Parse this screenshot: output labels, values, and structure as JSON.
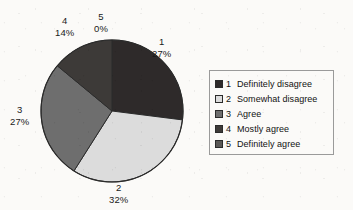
{
  "chart_data": {
    "type": "pie",
    "title": "",
    "categories": [
      "1",
      "2",
      "3",
      "4",
      "5"
    ],
    "values": [
      27,
      32,
      27,
      14,
      0
    ],
    "value_unit": "%",
    "labels": [
      {
        "name": "1",
        "pct": "27%"
      },
      {
        "name": "2",
        "pct": "32%"
      },
      {
        "name": "3",
        "pct": "27%"
      },
      {
        "name": "4",
        "pct": "14%"
      },
      {
        "name": "5",
        "pct": "0%"
      }
    ],
    "legend": {
      "position": "right",
      "entries": [
        {
          "key": "1",
          "label": "Definitely disagree",
          "color": "#2e2a2a"
        },
        {
          "key": "2",
          "label": "Somewhat disagree",
          "color": "#dcdcdc"
        },
        {
          "key": "3",
          "label": "Agree",
          "color": "#6e6e6e"
        },
        {
          "key": "4",
          "label": "Mostly agree",
          "color": "#3d3a38"
        },
        {
          "key": "5",
          "label": "Definitely agree",
          "color": "#5a5856"
        }
      ]
    },
    "start_angle_deg": 0,
    "direction": "clockwise",
    "grid": false,
    "xlabel": "",
    "ylabel": "",
    "colors": [
      "#2e2a2a",
      "#dcdcdc",
      "#6e6e6e",
      "#3d3a38",
      "#5a5856"
    ],
    "outline_color": "#2b2b2b",
    "background_color": "#fbfaf8"
  }
}
